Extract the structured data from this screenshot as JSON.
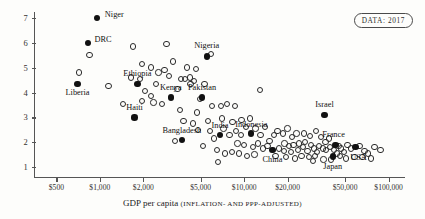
{
  "badge": {
    "label": "DATA: 2017"
  },
  "chart_data": {
    "type": "scatter",
    "title": "",
    "xlabel": "GDP per capita",
    "xlabel_sub": "(INFLATION- AND PPP-ADJUSTED)",
    "ylabel": "",
    "xscale": "log",
    "xlim": [
      350,
      130000
    ],
    "ylim": [
      0.6,
      7.4
    ],
    "grid": false,
    "legend": "none",
    "xticks": [
      {
        "value": 500,
        "label": "$500"
      },
      {
        "value": 1000,
        "label": "$1,000"
      },
      {
        "value": 2000,
        "label": "$2,000"
      },
      {
        "value": 5000,
        "label": "$5,000"
      },
      {
        "value": 10000,
        "label": "$10,000"
      },
      {
        "value": 20000,
        "label": "$20,000"
      },
      {
        "value": 50000,
        "label": "$50,000"
      },
      {
        "value": 100000,
        "label": "$100,000"
      }
    ],
    "yticks": [
      {
        "value": 1,
        "label": "1"
      },
      {
        "value": 2,
        "label": "2"
      },
      {
        "value": 3,
        "label": "3"
      },
      {
        "value": 4,
        "label": "4"
      },
      {
        "value": 5,
        "label": "5"
      },
      {
        "value": 6,
        "label": "6"
      },
      {
        "value": 7,
        "label": "7"
      }
    ],
    "labeled_points": [
      {
        "name": "Niger",
        "x": 960,
        "y": 7.0,
        "label_dx": 17,
        "label_dy": -4
      },
      {
        "name": "DRC",
        "x": 830,
        "y": 6.0,
        "label_dx": 15,
        "label_dy": -4
      },
      {
        "name": "Nigeria",
        "x": 5500,
        "y": 5.45,
        "label_dx": 0,
        "label_dy": -12
      },
      {
        "name": "Ethiopia",
        "x": 1820,
        "y": 4.35,
        "label_dx": 0,
        "label_dy": -11
      },
      {
        "name": "Liberia",
        "x": 700,
        "y": 4.35,
        "label_dx": 0,
        "label_dy": 8
      },
      {
        "name": "Kenya",
        "x": 3100,
        "y": 3.8,
        "label_dx": 0,
        "label_dy": -11
      },
      {
        "name": "Pakistan",
        "x": 5100,
        "y": 3.8,
        "label_dx": 0,
        "label_dy": -11
      },
      {
        "name": "Haiti",
        "x": 1740,
        "y": 3.0,
        "label_dx": 0,
        "label_dy": -10
      },
      {
        "name": "Bangladesh",
        "x": 3700,
        "y": 2.1,
        "label_dx": 0,
        "label_dy": -10
      },
      {
        "name": "India",
        "x": 6800,
        "y": 2.3,
        "label_dx": 0,
        "label_dy": -10
      },
      {
        "name": "Indonesia",
        "x": 11200,
        "y": 2.35,
        "label_dx": 0,
        "label_dy": -10
      },
      {
        "name": "China",
        "x": 15700,
        "y": 1.7,
        "label_dx": 0,
        "label_dy": 9
      },
      {
        "name": "Israel",
        "x": 36000,
        "y": 3.1,
        "label_dx": 0,
        "label_dy": -11
      },
      {
        "name": "France",
        "x": 43000,
        "y": 1.9,
        "label_dx": -2,
        "label_dy": -11
      },
      {
        "name": "USA",
        "x": 59000,
        "y": 1.8,
        "label_dx": 3,
        "label_dy": 10
      },
      {
        "name": "Japan",
        "x": 41000,
        "y": 1.43,
        "label_dx": 0,
        "label_dy": 10
      }
    ],
    "unlabeled_points": [
      {
        "x": 850,
        "y": 5.5
      },
      {
        "x": 720,
        "y": 4.8
      },
      {
        "x": 1150,
        "y": 4.25
      },
      {
        "x": 1700,
        "y": 5.85
      },
      {
        "x": 2900,
        "y": 5.95
      },
      {
        "x": 5900,
        "y": 5.55
      },
      {
        "x": 1950,
        "y": 5.15
      },
      {
        "x": 2250,
        "y": 5.0
      },
      {
        "x": 3200,
        "y": 5.25
      },
      {
        "x": 2550,
        "y": 4.8
      },
      {
        "x": 2800,
        "y": 4.9
      },
      {
        "x": 3000,
        "y": 4.65
      },
      {
        "x": 1650,
        "y": 4.6
      },
      {
        "x": 1900,
        "y": 4.55
      },
      {
        "x": 2050,
        "y": 4.05
      },
      {
        "x": 2250,
        "y": 3.85
      },
      {
        "x": 2350,
        "y": 3.6
      },
      {
        "x": 3650,
        "y": 4.55
      },
      {
        "x": 3900,
        "y": 4.55
      },
      {
        "x": 4200,
        "y": 4.6
      },
      {
        "x": 4500,
        "y": 4.45
      },
      {
        "x": 4250,
        "y": 4.35
      },
      {
        "x": 5300,
        "y": 4.35
      },
      {
        "x": 3450,
        "y": 4.15
      },
      {
        "x": 4950,
        "y": 3.75
      },
      {
        "x": 1450,
        "y": 3.55
      },
      {
        "x": 3600,
        "y": 3.3
      },
      {
        "x": 6000,
        "y": 3.45
      },
      {
        "x": 6900,
        "y": 3.45
      },
      {
        "x": 7600,
        "y": 3.55
      },
      {
        "x": 8600,
        "y": 3.45
      },
      {
        "x": 4700,
        "y": 3.2
      },
      {
        "x": 7000,
        "y": 2.95
      },
      {
        "x": 8300,
        "y": 2.8
      },
      {
        "x": 9600,
        "y": 2.9
      },
      {
        "x": 11000,
        "y": 2.95
      },
      {
        "x": 3300,
        "y": 2.05
      },
      {
        "x": 4800,
        "y": 2.5
      },
      {
        "x": 5800,
        "y": 2.45
      },
      {
        "x": 6200,
        "y": 2.15
      },
      {
        "x": 7200,
        "y": 2.55
      },
      {
        "x": 7900,
        "y": 2.3
      },
      {
        "x": 8800,
        "y": 2.45
      },
      {
        "x": 9500,
        "y": 2.3
      },
      {
        "x": 10300,
        "y": 2.6
      },
      {
        "x": 12000,
        "y": 2.55
      },
      {
        "x": 13000,
        "y": 2.3
      },
      {
        "x": 14000,
        "y": 2.6
      },
      {
        "x": 9000,
        "y": 1.95
      },
      {
        "x": 10000,
        "y": 1.9
      },
      {
        "x": 11500,
        "y": 1.8
      },
      {
        "x": 12500,
        "y": 1.95
      },
      {
        "x": 13500,
        "y": 1.75
      },
      {
        "x": 14500,
        "y": 1.85
      },
      {
        "x": 6500,
        "y": 1.7
      },
      {
        "x": 7400,
        "y": 1.55
      },
      {
        "x": 8200,
        "y": 1.6
      },
      {
        "x": 9200,
        "y": 1.55
      },
      {
        "x": 10500,
        "y": 1.45
      },
      {
        "x": 11800,
        "y": 1.5
      },
      {
        "x": 16000,
        "y": 2.3
      },
      {
        "x": 17000,
        "y": 2.45
      },
      {
        "x": 18500,
        "y": 2.35
      },
      {
        "x": 20000,
        "y": 2.55
      },
      {
        "x": 21500,
        "y": 2.2
      },
      {
        "x": 23000,
        "y": 2.35
      },
      {
        "x": 19000,
        "y": 1.95
      },
      {
        "x": 20500,
        "y": 1.85
      },
      {
        "x": 22000,
        "y": 1.9
      },
      {
        "x": 24000,
        "y": 1.95
      },
      {
        "x": 17500,
        "y": 1.75
      },
      {
        "x": 18800,
        "y": 1.65
      },
      {
        "x": 21000,
        "y": 1.6
      },
      {
        "x": 23500,
        "y": 1.7
      },
      {
        "x": 25500,
        "y": 1.8
      },
      {
        "x": 26500,
        "y": 2.0
      },
      {
        "x": 27500,
        "y": 1.65
      },
      {
        "x": 29000,
        "y": 1.9
      },
      {
        "x": 30500,
        "y": 1.75
      },
      {
        "x": 32000,
        "y": 1.6
      },
      {
        "x": 16500,
        "y": 1.45
      },
      {
        "x": 19500,
        "y": 1.4
      },
      {
        "x": 22500,
        "y": 1.35
      },
      {
        "x": 25000,
        "y": 1.45
      },
      {
        "x": 28000,
        "y": 1.4
      },
      {
        "x": 31000,
        "y": 1.45
      },
      {
        "x": 26000,
        "y": 2.35
      },
      {
        "x": 28500,
        "y": 2.25
      },
      {
        "x": 31500,
        "y": 2.45
      },
      {
        "x": 34000,
        "y": 2.2
      },
      {
        "x": 36500,
        "y": 2.0
      },
      {
        "x": 38500,
        "y": 2.15
      },
      {
        "x": 33000,
        "y": 1.85
      },
      {
        "x": 35000,
        "y": 1.75
      },
      {
        "x": 37000,
        "y": 1.7
      },
      {
        "x": 39500,
        "y": 1.8
      },
      {
        "x": 42000,
        "y": 1.7
      },
      {
        "x": 45000,
        "y": 1.85
      },
      {
        "x": 47000,
        "y": 1.75
      },
      {
        "x": 49000,
        "y": 1.6
      },
      {
        "x": 44000,
        "y": 1.55
      },
      {
        "x": 46000,
        "y": 1.45
      },
      {
        "x": 52000,
        "y": 1.9
      },
      {
        "x": 55000,
        "y": 1.75
      },
      {
        "x": 63000,
        "y": 1.85
      },
      {
        "x": 68000,
        "y": 1.65
      },
      {
        "x": 72000,
        "y": 1.55
      },
      {
        "x": 80000,
        "y": 1.8
      },
      {
        "x": 88000,
        "y": 1.7
      },
      {
        "x": 66000,
        "y": 1.4
      },
      {
        "x": 76000,
        "y": 1.35
      },
      {
        "x": 58000,
        "y": 1.4
      },
      {
        "x": 51000,
        "y": 1.35
      },
      {
        "x": 40000,
        "y": 1.3
      },
      {
        "x": 35500,
        "y": 1.3
      },
      {
        "x": 30000,
        "y": 1.25
      },
      {
        "x": 6600,
        "y": 1.2
      },
      {
        "x": 5200,
        "y": 1.85
      },
      {
        "x": 4400,
        "y": 2.75
      },
      {
        "x": 5600,
        "y": 2.85
      },
      {
        "x": 2700,
        "y": 3.55
      },
      {
        "x": 1950,
        "y": 3.65
      },
      {
        "x": 12800,
        "y": 4.1
      },
      {
        "x": 4000,
        "y": 5.0
      },
      {
        "x": 2450,
        "y": 4.35
      },
      {
        "x": 4650,
        "y": 4.95
      },
      {
        "x": 3800,
        "y": 2.85
      },
      {
        "x": 15000,
        "y": 2.05
      }
    ]
  }
}
